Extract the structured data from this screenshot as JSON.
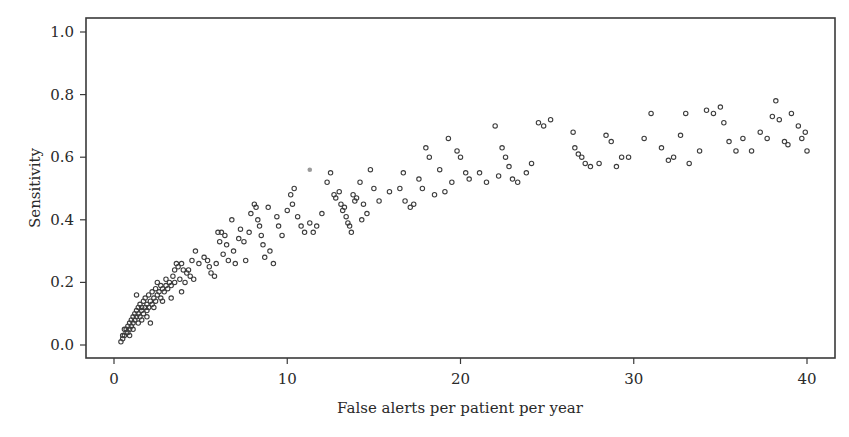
{
  "chart_data": {
    "type": "scatter",
    "title": "",
    "xlabel": "False alerts per patient per year",
    "ylabel": "Sensitivity",
    "xlim": [
      -1.5,
      41.8
    ],
    "ylim": [
      -0.04,
      1.05
    ],
    "xticks": [
      0,
      10,
      20,
      30,
      40
    ],
    "xtick_labels": [
      "0",
      "10",
      "20",
      "30",
      "40"
    ],
    "yticks": [
      0.0,
      0.2,
      0.4,
      0.6,
      0.8,
      1.0
    ],
    "ytick_labels": [
      "0.0",
      "0.2",
      "0.4",
      "0.6",
      "0.8",
      "1.0"
    ],
    "grid": false,
    "legend": null,
    "marker": "open-circle",
    "series": [
      {
        "name": "detector-configurations",
        "points": [
          [
            0.4,
            0.01
          ],
          [
            0.5,
            0.02
          ],
          [
            0.5,
            0.03
          ],
          [
            0.6,
            0.03
          ],
          [
            0.7,
            0.04
          ],
          [
            0.7,
            0.05
          ],
          [
            0.8,
            0.04
          ],
          [
            0.8,
            0.06
          ],
          [
            0.9,
            0.05
          ],
          [
            0.9,
            0.07
          ],
          [
            1.0,
            0.06
          ],
          [
            1.0,
            0.08
          ],
          [
            1.1,
            0.07
          ],
          [
            1.1,
            0.09
          ],
          [
            1.2,
            0.08
          ],
          [
            1.2,
            0.1
          ],
          [
            1.3,
            0.09
          ],
          [
            1.3,
            0.11
          ],
          [
            1.4,
            0.1
          ],
          [
            1.4,
            0.12
          ],
          [
            1.5,
            0.09
          ],
          [
            1.5,
            0.13
          ],
          [
            1.6,
            0.11
          ],
          [
            1.6,
            0.12
          ],
          [
            1.7,
            0.1
          ],
          [
            1.7,
            0.14
          ],
          [
            1.8,
            0.12
          ],
          [
            1.8,
            0.15
          ],
          [
            1.9,
            0.11
          ],
          [
            1.9,
            0.13
          ],
          [
            2.0,
            0.12
          ],
          [
            2.0,
            0.16
          ],
          [
            2.1,
            0.14
          ],
          [
            2.2,
            0.13
          ],
          [
            2.2,
            0.17
          ],
          [
            2.3,
            0.15
          ],
          [
            2.4,
            0.14
          ],
          [
            2.4,
            0.18
          ],
          [
            2.5,
            0.16
          ],
          [
            2.5,
            0.2
          ],
          [
            2.6,
            0.17
          ],
          [
            2.7,
            0.15
          ],
          [
            2.7,
            0.19
          ],
          [
            2.8,
            0.18
          ],
          [
            2.9,
            0.17
          ],
          [
            3.0,
            0.19
          ],
          [
            3.0,
            0.21
          ],
          [
            3.1,
            0.18
          ],
          [
            3.2,
            0.2
          ],
          [
            3.3,
            0.19
          ],
          [
            3.4,
            0.22
          ],
          [
            3.5,
            0.24
          ],
          [
            3.5,
            0.2
          ],
          [
            3.6,
            0.26
          ],
          [
            3.7,
            0.25
          ],
          [
            3.8,
            0.21
          ],
          [
            3.9,
            0.26
          ],
          [
            4.0,
            0.24
          ],
          [
            4.1,
            0.2
          ],
          [
            4.2,
            0.23
          ],
          [
            4.3,
            0.24
          ],
          [
            4.4,
            0.22
          ],
          [
            4.5,
            0.27
          ],
          [
            4.6,
            0.21
          ],
          [
            4.7,
            0.3
          ],
          [
            2.1,
            0.07
          ],
          [
            1.3,
            0.16
          ],
          [
            5.2,
            0.28
          ],
          [
            5.5,
            0.25
          ],
          [
            5.6,
            0.23
          ],
          [
            5.8,
            0.22
          ],
          [
            5.9,
            0.26
          ],
          [
            6.0,
            0.36
          ],
          [
            6.1,
            0.33
          ],
          [
            6.2,
            0.36
          ],
          [
            6.4,
            0.35
          ],
          [
            6.5,
            0.32
          ],
          [
            6.6,
            0.27
          ],
          [
            6.8,
            0.4
          ],
          [
            6.9,
            0.3
          ],
          [
            7.0,
            0.26
          ],
          [
            7.2,
            0.34
          ],
          [
            7.3,
            0.37
          ],
          [
            7.5,
            0.33
          ],
          [
            7.6,
            0.27
          ],
          [
            7.9,
            0.42
          ],
          [
            8.1,
            0.45
          ],
          [
            8.2,
            0.44
          ],
          [
            8.3,
            0.4
          ],
          [
            8.4,
            0.38
          ],
          [
            8.5,
            0.35
          ],
          [
            8.6,
            0.32
          ],
          [
            8.7,
            0.28
          ],
          [
            8.9,
            0.44
          ],
          [
            9.0,
            0.3
          ],
          [
            9.2,
            0.26
          ],
          [
            9.5,
            0.38
          ],
          [
            9.7,
            0.35
          ],
          [
            10.0,
            0.43
          ],
          [
            10.2,
            0.48
          ],
          [
            10.4,
            0.5
          ],
          [
            10.6,
            0.41
          ],
          [
            10.8,
            0.38
          ],
          [
            11.0,
            0.36
          ],
          [
            11.3,
            0.39
          ],
          [
            11.5,
            0.36
          ],
          [
            11.7,
            0.38
          ],
          [
            12.0,
            0.42
          ],
          [
            12.3,
            0.52
          ],
          [
            12.5,
            0.55
          ],
          [
            12.8,
            0.47
          ],
          [
            13.0,
            0.49
          ],
          [
            13.1,
            0.45
          ],
          [
            13.2,
            0.43
          ],
          [
            13.3,
            0.44
          ],
          [
            13.4,
            0.41
          ],
          [
            13.5,
            0.39
          ],
          [
            13.6,
            0.38
          ],
          [
            13.7,
            0.36
          ],
          [
            13.8,
            0.48
          ],
          [
            14.0,
            0.47
          ],
          [
            14.2,
            0.52
          ],
          [
            14.4,
            0.45
          ],
          [
            14.6,
            0.42
          ],
          [
            14.8,
            0.56
          ],
          [
            15.0,
            0.5
          ],
          [
            15.3,
            0.46
          ],
          [
            16.5,
            0.5
          ],
          [
            16.8,
            0.46
          ],
          [
            17.1,
            0.44
          ],
          [
            17.3,
            0.45
          ],
          [
            17.6,
            0.53
          ],
          [
            17.8,
            0.5
          ],
          [
            18.0,
            0.63
          ],
          [
            18.2,
            0.6
          ],
          [
            18.5,
            0.48
          ],
          [
            18.8,
            0.56
          ],
          [
            19.1,
            0.49
          ],
          [
            19.3,
            0.66
          ],
          [
            19.5,
            0.52
          ],
          [
            19.8,
            0.62
          ],
          [
            20.0,
            0.6
          ],
          [
            20.3,
            0.55
          ],
          [
            20.5,
            0.53
          ],
          [
            21.1,
            0.55
          ],
          [
            21.5,
            0.52
          ],
          [
            22.0,
            0.7
          ],
          [
            22.2,
            0.54
          ],
          [
            22.4,
            0.63
          ],
          [
            22.6,
            0.6
          ],
          [
            22.8,
            0.57
          ],
          [
            23.0,
            0.53
          ],
          [
            23.3,
            0.52
          ],
          [
            23.8,
            0.55
          ],
          [
            24.1,
            0.58
          ],
          [
            24.5,
            0.71
          ],
          [
            24.8,
            0.7
          ],
          [
            25.2,
            0.72
          ],
          [
            26.5,
            0.68
          ],
          [
            26.6,
            0.63
          ],
          [
            26.8,
            0.61
          ],
          [
            27.0,
            0.6
          ],
          [
            27.2,
            0.58
          ],
          [
            27.5,
            0.57
          ],
          [
            28.0,
            0.58
          ],
          [
            28.4,
            0.67
          ],
          [
            28.7,
            0.65
          ],
          [
            29.0,
            0.57
          ],
          [
            29.3,
            0.6
          ],
          [
            29.7,
            0.6
          ],
          [
            30.6,
            0.66
          ],
          [
            31.0,
            0.74
          ],
          [
            31.6,
            0.63
          ],
          [
            32.0,
            0.59
          ],
          [
            32.3,
            0.6
          ],
          [
            32.7,
            0.67
          ],
          [
            33.0,
            0.74
          ],
          [
            33.2,
            0.58
          ],
          [
            33.8,
            0.62
          ],
          [
            34.2,
            0.75
          ],
          [
            34.6,
            0.74
          ],
          [
            35.0,
            0.76
          ],
          [
            35.2,
            0.71
          ],
          [
            35.5,
            0.65
          ],
          [
            35.9,
            0.62
          ],
          [
            36.3,
            0.66
          ],
          [
            36.8,
            0.62
          ],
          [
            37.3,
            0.68
          ],
          [
            37.7,
            0.66
          ],
          [
            38.0,
            0.73
          ],
          [
            38.2,
            0.78
          ],
          [
            38.4,
            0.72
          ],
          [
            38.7,
            0.65
          ],
          [
            38.9,
            0.64
          ],
          [
            39.1,
            0.74
          ],
          [
            39.5,
            0.7
          ],
          [
            39.7,
            0.66
          ],
          [
            39.9,
            0.68
          ],
          [
            40.0,
            0.62
          ],
          [
            16.7,
            0.55
          ],
          [
            15.9,
            0.49
          ],
          [
            14.3,
            0.4
          ],
          [
            13.9,
            0.46
          ],
          [
            12.7,
            0.48
          ],
          [
            10.3,
            0.45
          ],
          [
            9.4,
            0.41
          ],
          [
            7.8,
            0.36
          ],
          [
            6.3,
            0.29
          ],
          [
            5.4,
            0.27
          ],
          [
            4.9,
            0.26
          ],
          [
            3.9,
            0.17
          ],
          [
            3.3,
            0.15
          ],
          [
            2.8,
            0.14
          ],
          [
            2.3,
            0.12
          ],
          [
            1.9,
            0.09
          ],
          [
            1.6,
            0.08
          ],
          [
            1.1,
            0.05
          ],
          [
            0.9,
            0.03
          ],
          [
            0.6,
            0.05
          ],
          [
            1.4,
            0.07
          ]
        ]
      }
    ],
    "highlight_points": [
      {
        "x": 11.3,
        "y": 0.56,
        "note": "single filled gray marker"
      }
    ]
  }
}
